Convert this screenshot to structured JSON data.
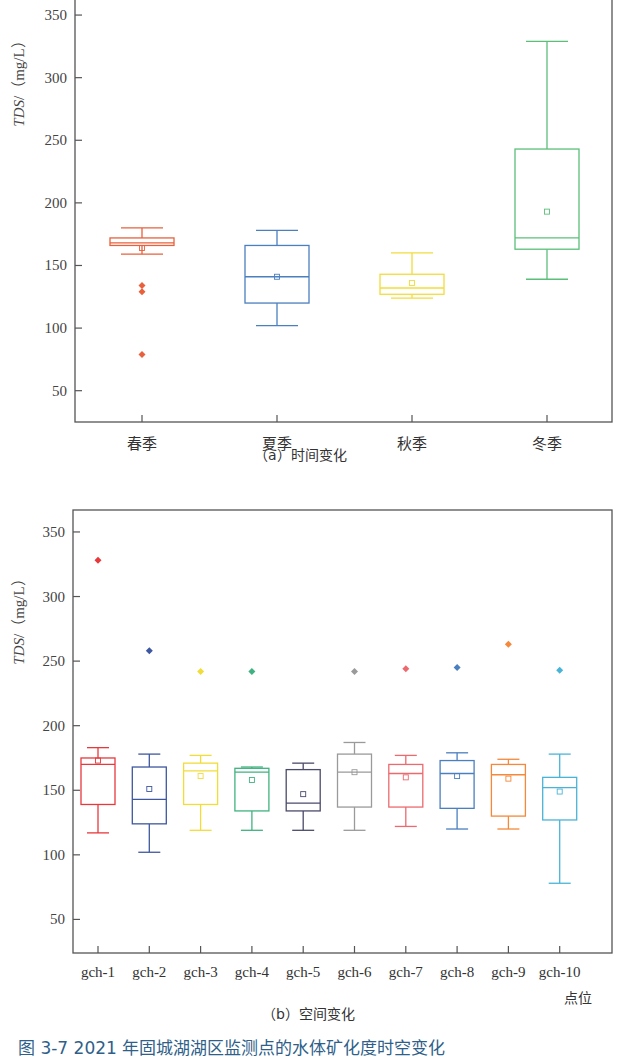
{
  "figure": {
    "caption": "图 3-7  2021 年固城湖湖区监测点的水体矿化度时空变化",
    "caption_color": "#2f5f8a"
  },
  "chart_data": [
    {
      "id": "a",
      "type": "box",
      "title": "",
      "sub_caption": "（a）时间变化",
      "xlabel": "",
      "ylabel_italic": "TDS",
      "ylabel_unit": "/（mg/L）",
      "ylim": [
        25,
        378
      ],
      "yticks": [
        50,
        100,
        150,
        200,
        250,
        300,
        350
      ],
      "grid": false,
      "legend": "none",
      "categories": [
        "春季",
        "夏季",
        "秋季",
        "冬季"
      ],
      "colors": [
        "#e8603c",
        "#4a7fc0",
        "#f2dc3a",
        "#5bbf7a"
      ],
      "series": [
        {
          "name": "春季",
          "whisker_high": 180,
          "q3": 172,
          "median": 168,
          "q1": 166,
          "whisker_low": 159,
          "mean": 164,
          "outliers": [
            134,
            129,
            79
          ]
        },
        {
          "name": "夏季",
          "whisker_high": 178,
          "q3": 166,
          "median": 141,
          "q1": 120,
          "whisker_low": 102,
          "mean": 141,
          "outliers": []
        },
        {
          "name": "秋季",
          "whisker_high": 160,
          "q3": 143,
          "median": 132,
          "q1": 127,
          "whisker_low": 124,
          "mean": 136,
          "outliers": []
        },
        {
          "name": "冬季",
          "whisker_high": 329,
          "q3": 243,
          "median": 172,
          "q1": 163,
          "whisker_low": 139,
          "mean": 193,
          "outliers": []
        }
      ]
    },
    {
      "id": "b",
      "type": "box",
      "title": "",
      "sub_caption": "（b）空间变化",
      "xlabel": "点位",
      "ylabel_italic": "TDS",
      "ylabel_unit": "/（mg/L）",
      "ylim": [
        24,
        367
      ],
      "yticks": [
        50,
        100,
        150,
        200,
        250,
        300,
        350
      ],
      "grid": false,
      "legend": "none",
      "categories": [
        "gch-1",
        "gch-2",
        "gch-3",
        "gch-4",
        "gch-5",
        "gch-6",
        "gch-7",
        "gch-8",
        "gch-9",
        "gch-10"
      ],
      "colors": [
        "#e8383c",
        "#3e57a0",
        "#f2dc3a",
        "#3fb27f",
        "#4a4a6a",
        "#9a9a9a",
        "#ec6a6e",
        "#4a7fc0",
        "#f5883a",
        "#4ab4d8"
      ],
      "series": [
        {
          "name": "gch-1",
          "whisker_high": 183,
          "q3": 175,
          "median": 170,
          "q1": 139,
          "whisker_low": 117,
          "mean": 173,
          "outliers": [
            328
          ]
        },
        {
          "name": "gch-2",
          "whisker_high": 178,
          "q3": 168,
          "median": 143,
          "q1": 124,
          "whisker_low": 102,
          "mean": 151,
          "outliers": [
            258
          ]
        },
        {
          "name": "gch-3",
          "whisker_high": 177,
          "q3": 171,
          "median": 165,
          "q1": 139,
          "whisker_low": 119,
          "mean": 161,
          "outliers": [
            242
          ]
        },
        {
          "name": "gch-4",
          "whisker_high": 168,
          "q3": 167,
          "median": 164,
          "q1": 134,
          "whisker_low": 119,
          "mean": 158,
          "outliers": [
            242
          ]
        },
        {
          "name": "gch-5",
          "whisker_high": 171,
          "q3": 166,
          "median": 140,
          "q1": 134,
          "whisker_low": 119,
          "mean": 147,
          "outliers": []
        },
        {
          "name": "gch-6",
          "whisker_high": 187,
          "q3": 178,
          "median": 164,
          "q1": 137,
          "whisker_low": 119,
          "mean": 164,
          "outliers": [
            242
          ]
        },
        {
          "name": "gch-7",
          "whisker_high": 177,
          "q3": 170,
          "median": 163,
          "q1": 137,
          "whisker_low": 122,
          "mean": 160,
          "outliers": [
            244
          ]
        },
        {
          "name": "gch-8",
          "whisker_high": 179,
          "q3": 173,
          "median": 163,
          "q1": 136,
          "whisker_low": 120,
          "mean": 161,
          "outliers": [
            245
          ]
        },
        {
          "name": "gch-9",
          "whisker_high": 174,
          "q3": 170,
          "median": 162,
          "q1": 130,
          "whisker_low": 120,
          "mean": 159,
          "outliers": [
            263
          ]
        },
        {
          "name": "gch-10",
          "whisker_high": 178,
          "q3": 160,
          "median": 152,
          "q1": 127,
          "whisker_low": 78,
          "mean": 149,
          "outliers": [
            243
          ]
        }
      ]
    }
  ]
}
